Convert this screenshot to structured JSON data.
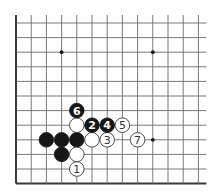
{
  "diagram": {
    "type": "go-board-fragment",
    "grid": {
      "cols": 13,
      "rows": 12,
      "origin_x": 16,
      "origin_y": 23,
      "spacing_x": 15.2,
      "spacing_y": 14.6,
      "open_top": true,
      "open_right": true,
      "border_left": true,
      "border_bottom": true
    },
    "star_points": [
      {
        "col": 3,
        "row": 2
      },
      {
        "col": 9,
        "row": 2
      },
      {
        "col": 9,
        "row": 8
      }
    ],
    "stones": [
      {
        "color": "black",
        "col": 2,
        "row": 8,
        "label": ""
      },
      {
        "color": "black",
        "col": 3,
        "row": 8,
        "label": ""
      },
      {
        "color": "black",
        "col": 4,
        "row": 8,
        "label": ""
      },
      {
        "color": "black",
        "col": 3,
        "row": 9,
        "label": ""
      },
      {
        "color": "white",
        "col": 4,
        "row": 9,
        "label": ""
      },
      {
        "color": "white",
        "col": 4,
        "row": 7,
        "label": ""
      },
      {
        "color": "white",
        "col": 5,
        "row": 8,
        "label": ""
      },
      {
        "color": "white",
        "col": 4,
        "row": 10,
        "label": "1"
      },
      {
        "color": "black",
        "col": 5,
        "row": 7,
        "label": "2"
      },
      {
        "color": "white",
        "col": 6,
        "row": 8,
        "label": "3"
      },
      {
        "color": "black",
        "col": 6,
        "row": 7,
        "label": "4"
      },
      {
        "color": "white",
        "col": 7,
        "row": 7,
        "label": "5"
      },
      {
        "color": "black",
        "col": 4,
        "row": 6,
        "label": "6"
      },
      {
        "color": "white",
        "col": 8,
        "row": 8,
        "label": "7"
      }
    ]
  }
}
